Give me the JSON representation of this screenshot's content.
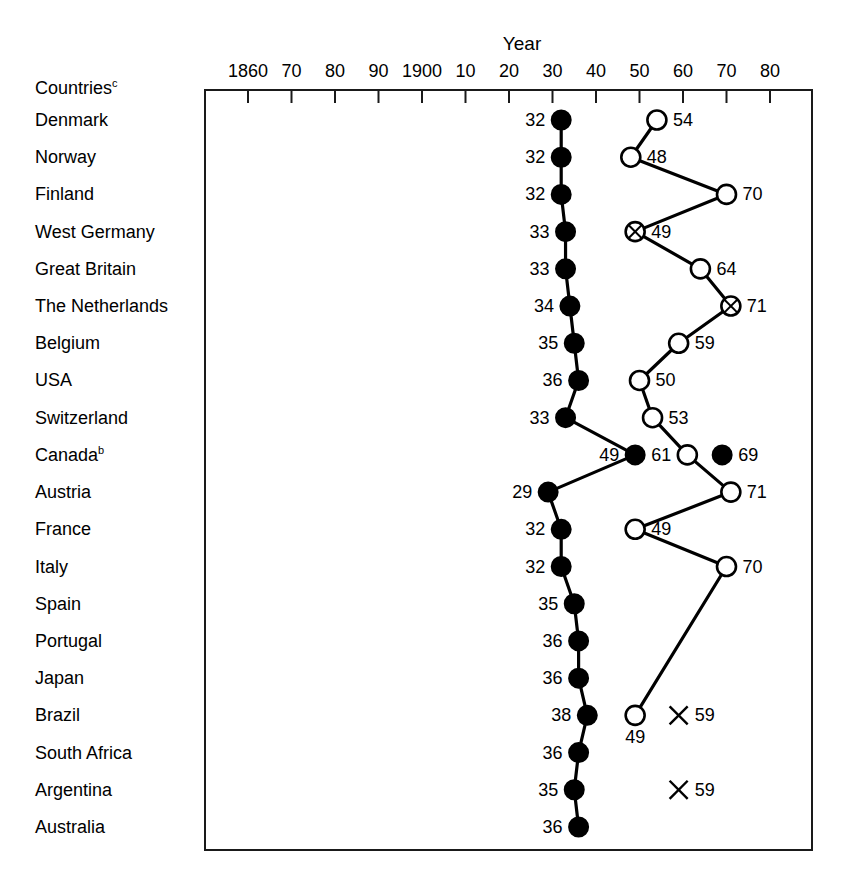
{
  "chart_data": {
    "type": "scatter",
    "title": "Year",
    "xlabel": "Year",
    "ylabel": "Countries",
    "ylabel_superscript": "c",
    "grid": false,
    "legend_position": "none",
    "xlim": [
      1855,
      1985
    ],
    "x_tick_values": [
      1860,
      1870,
      1880,
      1890,
      1900,
      1910,
      1920,
      1930,
      1940,
      1950,
      1960,
      1970,
      1980
    ],
    "x_tick_labels": [
      "1860",
      "70",
      "80",
      "90",
      "1900",
      "10",
      "20",
      "30",
      "40",
      "50",
      "60",
      "70",
      "80"
    ],
    "categories": [
      "Denmark",
      "Norway",
      "Finland",
      "West Germany",
      "Great Britain",
      "The Netherlands",
      "Belgium",
      "USA",
      "Switzerland",
      "Canada",
      "Austria",
      "France",
      "Italy",
      "Spain",
      "Portugal",
      "Japan",
      "Brazil",
      "South Africa",
      "Argentina",
      "Australia"
    ],
    "category_superscripts": {
      "Canada": "b"
    },
    "series": [
      {
        "name": "first-series",
        "marker": "filled-circle",
        "connected": true,
        "points": [
          {
            "country": "Denmark",
            "year": 1932,
            "label": "32",
            "label_side": "left"
          },
          {
            "country": "Norway",
            "year": 1932,
            "label": "32",
            "label_side": "left"
          },
          {
            "country": "Finland",
            "year": 1932,
            "label": "32",
            "label_side": "left"
          },
          {
            "country": "West Germany",
            "year": 1933,
            "label": "33",
            "label_side": "left"
          },
          {
            "country": "Great Britain",
            "year": 1933,
            "label": "33",
            "label_side": "left"
          },
          {
            "country": "The Netherlands",
            "year": 1934,
            "label": "34",
            "label_side": "left"
          },
          {
            "country": "Belgium",
            "year": 1935,
            "label": "35",
            "label_side": "left"
          },
          {
            "country": "USA",
            "year": 1936,
            "label": "36",
            "label_side": "left"
          },
          {
            "country": "Switzerland",
            "year": 1933,
            "label": "33",
            "label_side": "left"
          },
          {
            "country": "Canada",
            "year": 1949,
            "label": "49",
            "label_side": "left"
          },
          {
            "country": "Austria",
            "year": 1929,
            "label": "29",
            "label_side": "left"
          },
          {
            "country": "France",
            "year": 1932,
            "label": "32",
            "label_side": "left"
          },
          {
            "country": "Italy",
            "year": 1932,
            "label": "32",
            "label_side": "left"
          },
          {
            "country": "Spain",
            "year": 1935,
            "label": "35",
            "label_side": "left"
          },
          {
            "country": "Portugal",
            "year": 1936,
            "label": "36",
            "label_side": "left"
          },
          {
            "country": "Japan",
            "year": 1936,
            "label": "36",
            "label_side": "left"
          },
          {
            "country": "Brazil",
            "year": 1938,
            "label": "38",
            "label_side": "left"
          },
          {
            "country": "South Africa",
            "year": 1936,
            "label": "36",
            "label_side": "left"
          },
          {
            "country": "Argentina",
            "year": 1935,
            "label": "35",
            "label_side": "left"
          },
          {
            "country": "Australia",
            "year": 1936,
            "label": "36",
            "label_side": "left"
          }
        ]
      },
      {
        "name": "second-series",
        "marker": "open-circle",
        "connected": true,
        "points": [
          {
            "country": "Denmark",
            "year": 1954,
            "label": "54",
            "label_side": "right",
            "marker": "open-circle"
          },
          {
            "country": "Norway",
            "year": 1948,
            "label": "48",
            "label_side": "right",
            "marker": "open-circle"
          },
          {
            "country": "Finland",
            "year": 1970,
            "label": "70",
            "label_side": "right",
            "marker": "open-circle"
          },
          {
            "country": "West Germany",
            "year": 1949,
            "label": "49",
            "label_side": "right",
            "marker": "crossed-circle"
          },
          {
            "country": "Great Britain",
            "year": 1964,
            "label": "64",
            "label_side": "right",
            "marker": "open-circle"
          },
          {
            "country": "The Netherlands",
            "year": 1971,
            "label": "71",
            "label_side": "right",
            "marker": "crossed-circle"
          },
          {
            "country": "Belgium",
            "year": 1959,
            "label": "59",
            "label_side": "right",
            "marker": "open-circle"
          },
          {
            "country": "USA",
            "year": 1950,
            "label": "50",
            "label_side": "right",
            "marker": "open-circle"
          },
          {
            "country": "Switzerland",
            "year": 1953,
            "label": "53",
            "label_side": "right",
            "marker": "open-circle"
          },
          {
            "country": "Canada",
            "year": 1961,
            "label": "61",
            "label_side": "left",
            "marker": "open-circle"
          },
          {
            "country": "Austria",
            "year": 1971,
            "label": "71",
            "label_side": "right",
            "marker": "open-circle"
          },
          {
            "country": "France",
            "year": 1949,
            "label": "49",
            "label_side": "right",
            "marker": "open-circle"
          },
          {
            "country": "Italy",
            "year": 1970,
            "label": "70",
            "label_side": "right",
            "marker": "open-circle"
          },
          {
            "country": "Brazil",
            "year": 1949,
            "label": "49",
            "label_side": "below",
            "marker": "open-circle"
          }
        ]
      },
      {
        "name": "extra-filled-marker",
        "marker": "filled-circle",
        "connected": false,
        "points": [
          {
            "country": "Canada",
            "year": 1969,
            "label": "69",
            "label_side": "right"
          }
        ]
      },
      {
        "name": "cross-series",
        "marker": "cross",
        "connected": false,
        "points": [
          {
            "country": "Brazil",
            "year": 1959,
            "label": "59",
            "label_side": "right"
          },
          {
            "country": "Argentina",
            "year": 1959,
            "label": "59",
            "label_side": "right"
          }
        ]
      }
    ]
  },
  "axis": {
    "header_countries": "Countries",
    "header_countries_sup": "c",
    "title": "Year"
  },
  "colors": {
    "ink": "#000000",
    "background": "#ffffff",
    "frame": "#1a1a1a"
  }
}
